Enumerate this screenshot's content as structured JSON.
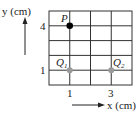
{
  "diagram": {
    "y_axis_label": "y (cm)",
    "x_axis_label": "x (cm)",
    "y_ticks": [
      {
        "label": "4"
      },
      {
        "label": "1"
      }
    ],
    "x_ticks": [
      {
        "label": "1"
      },
      {
        "label": "3"
      }
    ],
    "points": [
      {
        "name": "P",
        "x": 1,
        "y": 4,
        "color": "#000000"
      },
      {
        "name": "Q",
        "subscript": "1",
        "x": 1,
        "y": 1,
        "color": "#9a9a9a"
      },
      {
        "name": "Q",
        "subscript": "2",
        "x": 3,
        "y": 1,
        "color": "#9a9a9a"
      }
    ],
    "grid": {
      "columns": 4,
      "rows": 5,
      "line_color": "#333333"
    }
  }
}
